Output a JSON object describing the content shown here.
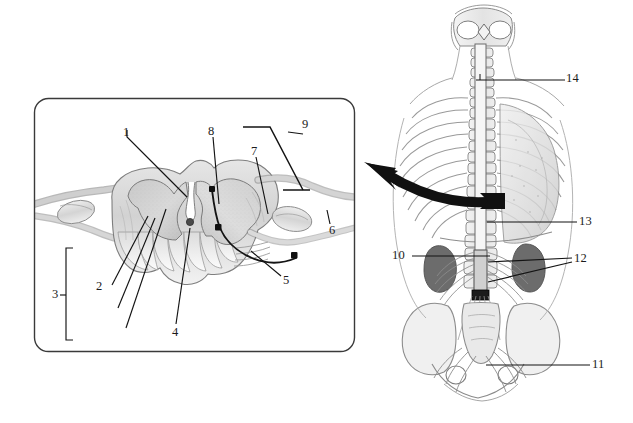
{
  "figure": {
    "domain_note": "anatomical line illustration with numbered leader labels",
    "background_color": "#ffffff",
    "ink_color": "#1b1b1b"
  },
  "panel": {
    "name": "spinal-cord-cross-section-panel",
    "shape": "rounded-rectangle",
    "x": 34,
    "y": 98,
    "width": 321,
    "height": 254,
    "corner_radius": 14,
    "border_color": "#3a3a3a",
    "border_width": 1.4
  },
  "arrow": {
    "name": "magnification-arrow",
    "direction": "left",
    "color": "#111111",
    "description": "thick curved arrow from trunk illustration to detail panel"
  },
  "panel_labels": [
    {
      "id": "1",
      "text": "1",
      "x": 123,
      "y": 126,
      "leader": "line from label down-right to dorsal median sulcus region"
    },
    {
      "id": "2",
      "text": "2",
      "x": 96,
      "y": 287,
      "leader": "three long lines up-right into white matter columns"
    },
    {
      "id": "3",
      "text": "3",
      "x": 56,
      "y": 295,
      "leader": "square bracket spanning white matter region"
    },
    {
      "id": "4",
      "text": "4",
      "x": 173,
      "y": 330,
      "leader": "line up-right to central canal"
    },
    {
      "id": "5",
      "text": "5",
      "x": 283,
      "y": 281,
      "leader": "line up-left to ventral root filaments"
    },
    {
      "id": "6",
      "text": "6",
      "x": 328,
      "y": 230,
      "leader": "short line up-left to spinal nerve"
    },
    {
      "id": "7",
      "text": "7",
      "x": 253,
      "y": 152,
      "leader": "line down-left into right dorsal horn"
    },
    {
      "id": "8",
      "text": "8",
      "x": 210,
      "y": 132,
      "leader": "line down to dorsal median septum"
    },
    {
      "id": "9",
      "text": "9",
      "x": 300,
      "y": 124,
      "leader": "zig-zag bracket leader at upper right of panel"
    }
  ],
  "trunk_labels": [
    {
      "id": "10",
      "text": "10",
      "x": 394,
      "y": 256,
      "leader": "horizontal line right to lumbar spinal region"
    },
    {
      "id": "11",
      "text": "11",
      "x": 593,
      "y": 365,
      "leader": "horizontal line left to sacral plexus"
    },
    {
      "id": "12",
      "text": "12",
      "x": 576,
      "y": 262,
      "leader": "two lines converging left to lumbar nerve roots"
    },
    {
      "id": "13",
      "text": "13",
      "x": 580,
      "y": 222,
      "leader": "horizontal line left to thoracolumbar cord"
    },
    {
      "id": "14",
      "text": "14",
      "x": 567,
      "y": 78,
      "leader": "horizontal line left to cervical spinal cord"
    }
  ],
  "illustration_parts": {
    "cross_section": [
      "dorsal (posterior) horn",
      "ventral (anterior) horn",
      "central canal",
      "white matter columns",
      "dorsal root",
      "dorsal root ganglion",
      "ventral root",
      "spinal nerve",
      "dorsal median sulcus",
      "ventral median fissure"
    ],
    "trunk": [
      "cervical vertebrae",
      "thoracic rib cage",
      "vertebral column",
      "spinal cord",
      "lumbar nerve roots",
      "cauda equina",
      "sacrum",
      "ilium",
      "sacral plexus",
      "kidney shadow",
      "lung field"
    ]
  },
  "palette": {
    "ink": "#1b1b1b",
    "line_gray": "#6e6e6e",
    "light_gray": "#cfcfcf",
    "mid_gray": "#a8a8a8",
    "dark_gray": "#555555",
    "tissue_fill": "#d8d8d8",
    "tissue_fill_light": "#e8e8e8",
    "tissue_fill_dark": "#b9b9b9"
  }
}
